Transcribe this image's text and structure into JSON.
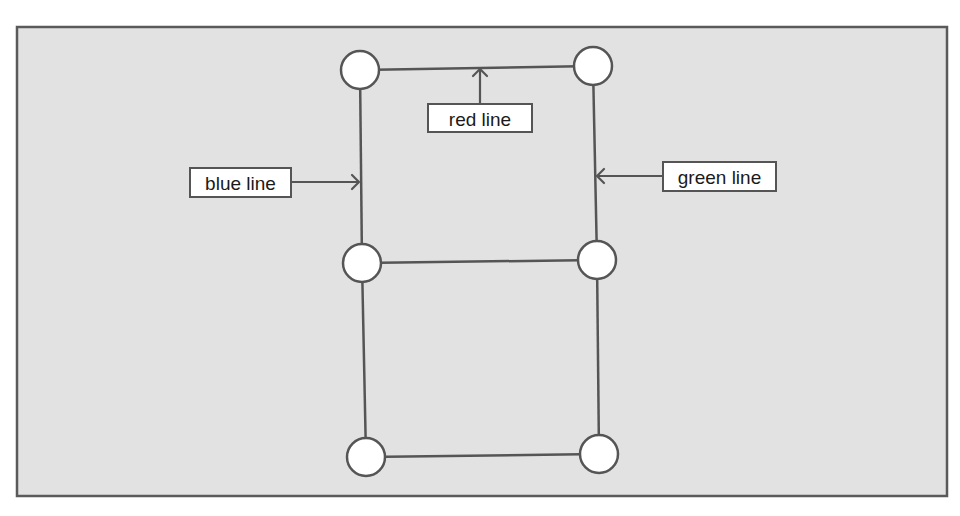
{
  "diagram": {
    "type": "node-edge-diagram",
    "colors": {
      "panel_fill": "#e2e2e2",
      "stroke": "#555555",
      "node_fill": "#ffffff",
      "label_fill": "#ffffff",
      "text": "#1a1a1a"
    },
    "nodes": [
      {
        "id": "top-left",
        "label": ""
      },
      {
        "id": "top-right",
        "label": ""
      },
      {
        "id": "middle-left",
        "label": ""
      },
      {
        "id": "middle-right",
        "label": ""
      },
      {
        "id": "bottom-left",
        "label": ""
      },
      {
        "id": "bottom-right",
        "label": ""
      }
    ],
    "edges": [
      {
        "id": "red-line",
        "from": "top-left",
        "to": "top-right",
        "name": "red line"
      },
      {
        "id": "blue-line",
        "from": "top-left",
        "to": "middle-left",
        "name": "blue line"
      },
      {
        "id": "green-line",
        "from": "top-right",
        "to": "middle-right",
        "name": "green line"
      },
      {
        "id": "middle-horizontal",
        "from": "middle-left",
        "to": "middle-right",
        "name": ""
      },
      {
        "id": "lower-left-vertical",
        "from": "middle-left",
        "to": "bottom-left",
        "name": ""
      },
      {
        "id": "lower-right-vertical",
        "from": "middle-right",
        "to": "bottom-right",
        "name": ""
      },
      {
        "id": "bottom-horizontal",
        "from": "bottom-left",
        "to": "bottom-right",
        "name": ""
      }
    ],
    "callouts": [
      {
        "id": "red",
        "text": "red line",
        "points_to": "red-line",
        "arrow_direction": "up"
      },
      {
        "id": "blue",
        "text": "blue line",
        "points_to": "blue-line",
        "arrow_direction": "right"
      },
      {
        "id": "green",
        "text": "green line",
        "points_to": "green-line",
        "arrow_direction": "left"
      }
    ]
  }
}
